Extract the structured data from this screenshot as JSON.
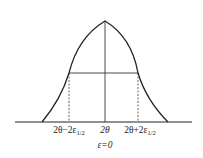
{
  "diagram": {
    "type": "diffraction peak profile (FWHM)",
    "labels": {
      "left": {
        "prefix": "2θ−2ε",
        "sub": "1/2"
      },
      "center": "2θ",
      "right": {
        "prefix": "2θ+2ε",
        "sub": "1/2"
      },
      "below_center": "ε=0"
    },
    "colors": {
      "line": "#222222",
      "background": "#ffffff"
    }
  }
}
